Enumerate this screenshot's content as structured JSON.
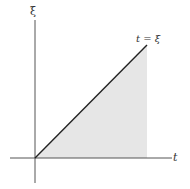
{
  "diagram": {
    "title": "",
    "vertical_axis_label": "ξ",
    "horizontal_axis_label": "t",
    "line_label": "t = ξ",
    "shaded_region": "triangle between line t = ξ and t-axis",
    "colors": {
      "axis": "#555555",
      "line": "#222222",
      "shade": "#e6e6e6"
    }
  }
}
